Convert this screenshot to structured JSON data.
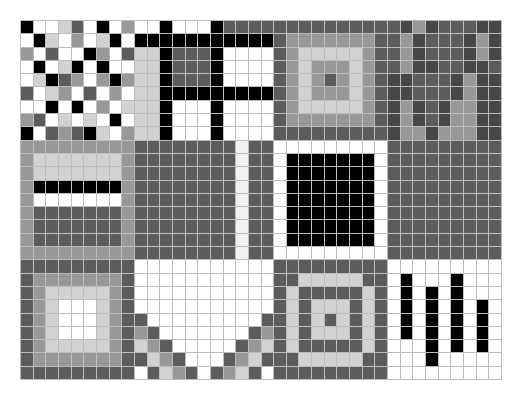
{
  "palette": {
    "K": "#000000",
    "X": "#474747",
    "D": "#5c5c5c",
    "M": "#989898",
    "L": "#d2d2d2",
    "W": "#ffffff",
    "S": "#f0f0f0"
  },
  "grid": {
    "columns": 38,
    "rows": 27,
    "cells": [
      "KWWLDWKWMWWKWWWKDDDDDDDDDDDDDDXMXDDDXXD",
      "WKLWMWLKWKKKKKKKKKKKDMMMMMMMDDMXDDDXMX",
      "MWDWWKMWDLLKDDDKWWWWDMLLLLLMDDMXDDDXMX",
      "WKWLKWKWWLLKDDDKWWWWDMLMMMLMDDMXXDDXXD",
      "WLKDMWMKMLLKDDDKWWWWDMLMDMLMDXXDDDXMXX",
      "DWLMWDWMWLLKKKKKKKKKDMLMMMLMDXXDDDXMXX",
      "WWKWKWMWLLLKWWWKWWWWDMLLLLLMDXMXDXMMXX",
      "MDWLWLWKWLLKWWWKWWWWDMMMMMMMDXMXDXMMXX",
      "KWDMDKLWMLLKWWWKWWWWDDDDDDDDDXMMXMMMXX",
      "MMMMMMMMMDDDDDDDDSDDWWWWWWWWWDDDDDDDDD",
      "MLLLLLLLMDDDDDDDDSDDWKKKKKKKWDDDDDDDDD",
      "MLLLLLLLMDDDDDDDDSDDWKKKKKKKWDDDDDDDDD",
      "MKKKKKKKMDDDDDDDDSDDWKKKKKKKWDDDDDDDDD",
      "MWWWWWWWMDDDDDDDDSDDWKKKKKKKWDDDDDDDDD",
      "MDDDDDDDMDDDDDDDDSDDWKKKKKKKWDDDDDDDDD",
      "MDDDDDDDMDDDDDDDDSDDWKKKKKKKWDDDDDDDDD",
      "MDDDDDDDMDDDDDDDDSDDWKKKKKKKWDDDDDDDDD",
      "MMMMMMMMMDDDDDDDDSDDWWWWWWWWWDDDDDDDDD",
      "DDDDDDDDDWWWWWWWWWWWDDDDDDDDDWWWWWWWWW",
      "DMMMMMMMDWWWWWWWWWWWDDLLLLLDDWKWWWKWWW",
      "DMLLLLLMDWWWWWWWWWWWDLDDDDDLDWKWKWKWWW",
      "DMLWWWLMDWWWWWWWWWWWDLDLLLDLDWKWKWKWKW",
      "DMLWWWLMDDWWWWWWWWWDDLDLDLDLDWKWKWKWKW",
      "DMLWWWLMDMDWWWWWWWDMDLDLLLDLDWKWKWKWKW",
      "DMLLLLLMDLMDWWWWWDMLDLDDDDDLDWWWKWKWKW",
      "DMMMMMMMDDLMDWWWDMLDDDLLLLLDDWWWKWWWWW",
      "DDDDDDDDDWDLMDWDMLDWDDDDDDDDDWWWWWWWWW"
    ]
  }
}
